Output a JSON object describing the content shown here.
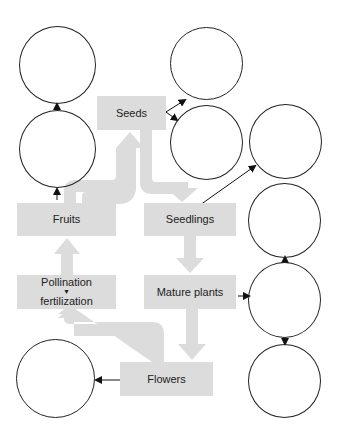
{
  "diagram": {
    "colors": {
      "box_fill": "#dcdcdc",
      "flow_arrow": "#dcdcdc",
      "line": "#222222",
      "text": "#222222"
    },
    "stages": [
      {
        "id": "seeds",
        "label": "Seeds"
      },
      {
        "id": "seedlings",
        "label": "Seedlings"
      },
      {
        "id": "mature_plants",
        "label": "Mature plants"
      },
      {
        "id": "flowers",
        "label": "Flowers"
      },
      {
        "id": "pollination",
        "label_line1": "Pollination",
        "label_line2": "fertilization"
      },
      {
        "id": "fruits",
        "label": "Fruits"
      }
    ],
    "flow": [
      "Seeds",
      "Seedlings",
      "Mature plants",
      "Flowers",
      "Pollination fertilization",
      "Fruits",
      "Seeds"
    ],
    "blank_circles": 9
  }
}
